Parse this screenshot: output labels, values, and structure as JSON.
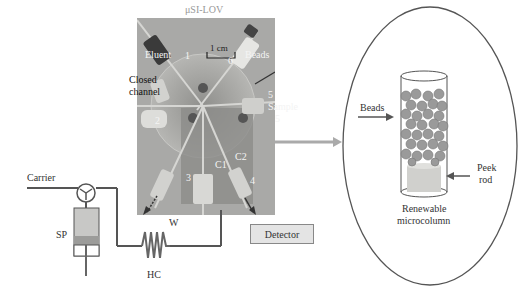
{
  "diagram": {
    "title": "μSI-LOV",
    "photo_labels": {
      "eluent": "Eluent",
      "beads": "Beads",
      "scale": "1 cm",
      "closed_channel": "Closed channel",
      "closed_channel_line1": "Closed",
      "closed_channel_line2": "channel",
      "sample": "Sample",
      "port_numbers": [
        "1",
        "2",
        "3",
        "4",
        "5",
        "6"
      ],
      "c1": "C1",
      "c2": "C2",
      "waste": "W"
    },
    "flow_components": {
      "carrier": "Carrier",
      "syringe_pump": "SP",
      "holding_coil": "HC",
      "detector": "Detector"
    },
    "inset": {
      "beads_label": "Beads",
      "peek_rod_line1": "Peek",
      "peek_rod_line2": "rod",
      "caption_line1": "Renewable",
      "caption_line2": "microcolumn"
    },
    "colors": {
      "photo_bg": "#a9a9a7",
      "line": "#555555",
      "arrow_gray": "#aaaaaa",
      "bead": "#9a9a9a",
      "detector_bg": "#e4e4e4"
    }
  }
}
